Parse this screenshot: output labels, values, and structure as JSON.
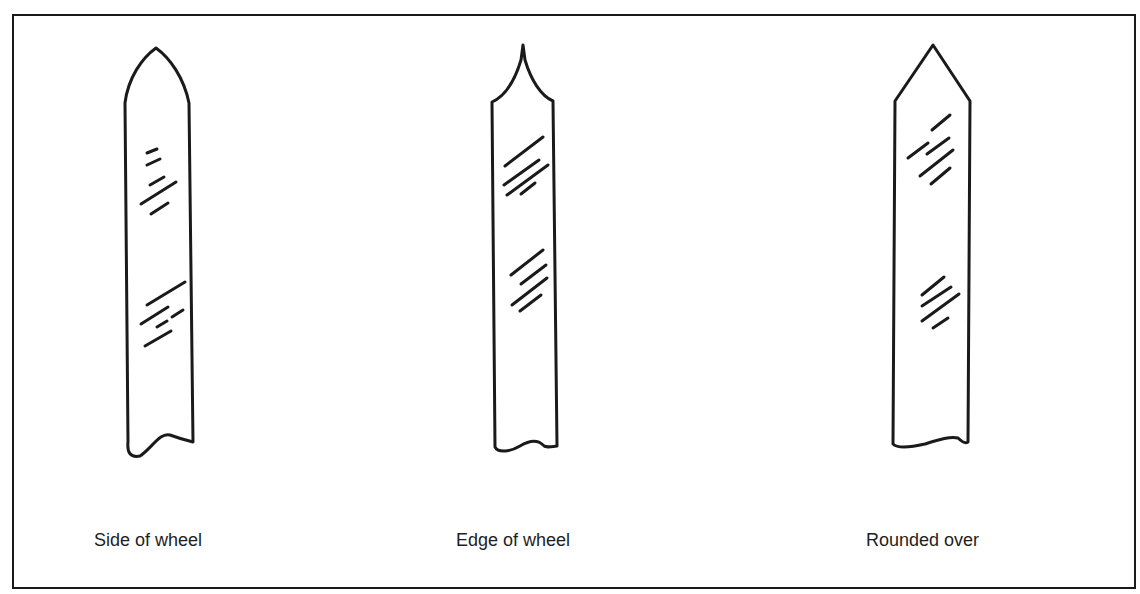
{
  "figure": {
    "stroke_color": "#1a1a1a",
    "background": "#ffffff",
    "panels": [
      {
        "id": "side",
        "label": "Side of wheel",
        "tip_shape": "ogive (convex curved point)"
      },
      {
        "id": "edge",
        "label": "Edge of wheel",
        "tip_shape": "concave curved point"
      },
      {
        "id": "rounded",
        "label": "Rounded over",
        "tip_shape": "straight bevel point"
      }
    ]
  }
}
